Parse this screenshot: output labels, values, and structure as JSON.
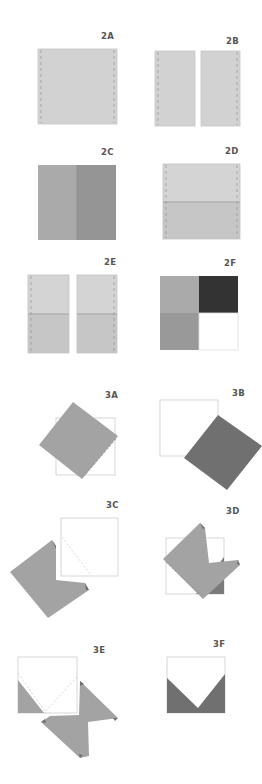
{
  "colors": {
    "light_gray": "#cfcfcf",
    "light_gray_lower": "#c4c4c4",
    "mid_gray": "#aaaaaa",
    "mid_gray_dark": "#959595",
    "dark_gray": "#7a7a7a",
    "charcoal": "#333333",
    "outline": "#cccccc",
    "dash": "#999999"
  },
  "steps": [
    {
      "id": "2A",
      "label": "2A",
      "x": 101,
      "y": 31
    },
    {
      "id": "2B",
      "label": "2B",
      "x": 226,
      "y": 36
    },
    {
      "id": "2C",
      "label": "2C",
      "x": 101,
      "y": 147
    },
    {
      "id": "2D",
      "label": "2D",
      "x": 225,
      "y": 146
    },
    {
      "id": "2E",
      "label": "2E",
      "x": 104,
      "y": 257
    },
    {
      "id": "2F",
      "label": "2F",
      "x": 224,
      "y": 258
    },
    {
      "id": "3A",
      "label": "3A",
      "x": 105,
      "y": 390
    },
    {
      "id": "3B",
      "label": "3B",
      "x": 232,
      "y": 388
    },
    {
      "id": "3C",
      "label": "3C",
      "x": 106,
      "y": 500
    },
    {
      "id": "3D",
      "label": "3D",
      "x": 226,
      "y": 506
    },
    {
      "id": "3E",
      "label": "3E",
      "x": 93,
      "y": 645
    },
    {
      "id": "3F",
      "label": "3F",
      "x": 213,
      "y": 639
    }
  ]
}
